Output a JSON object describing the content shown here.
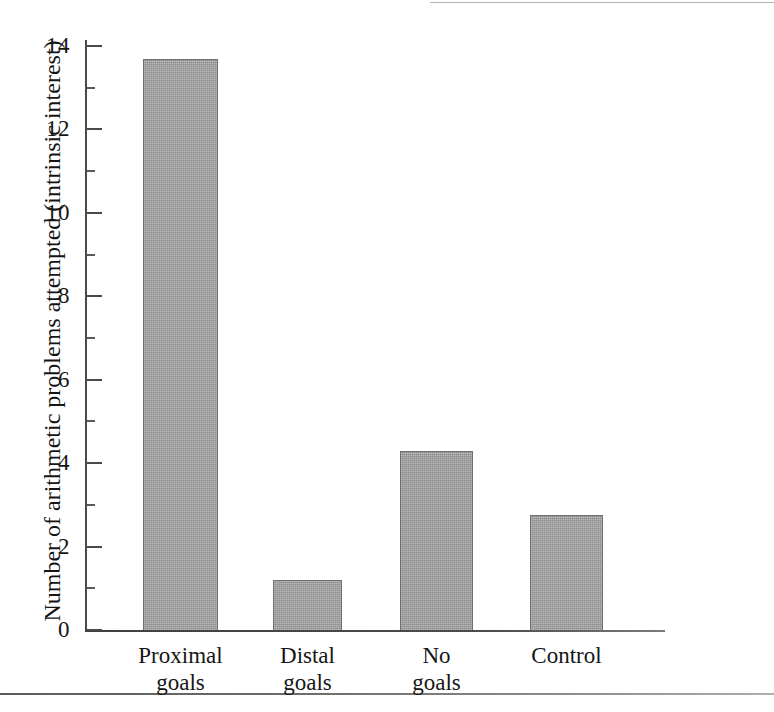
{
  "figure": {
    "background_color": "#ffffff",
    "bar_fill_color": "#9c9c9c",
    "bar_border_color": "#6f6f6f",
    "axis_color": "#4a4a4a",
    "text_color": "#161616"
  },
  "chart_data": {
    "type": "bar",
    "title": "",
    "subtitle": "",
    "xlabel": "",
    "ylabel": "Number of arithmetic problems attempted (intrinsic interest)",
    "categories": [
      "Proximal goals",
      "Distal goals",
      "No goals",
      "Control"
    ],
    "category_lines": [
      [
        "Proximal",
        "goals"
      ],
      [
        "Distal",
        "goals"
      ],
      [
        "No",
        "goals"
      ],
      [
        "Control"
      ]
    ],
    "values": [
      13.7,
      1.2,
      4.3,
      2.75
    ],
    "ylim": [
      0,
      14.2
    ],
    "ytick_major": [
      0,
      2,
      4,
      6,
      8,
      10,
      12,
      14
    ],
    "ytick_major_labels": [
      "0",
      "2",
      "4",
      "6",
      "8",
      "10",
      "12",
      "14"
    ],
    "ytick_minor": [
      1,
      3,
      5,
      7,
      9,
      11,
      13
    ],
    "grid": false,
    "legend": null,
    "legend_position": "none",
    "annotations": []
  },
  "axis": {
    "y_title": "Number of arithmetic problems attempted (intrinsic interest)"
  }
}
